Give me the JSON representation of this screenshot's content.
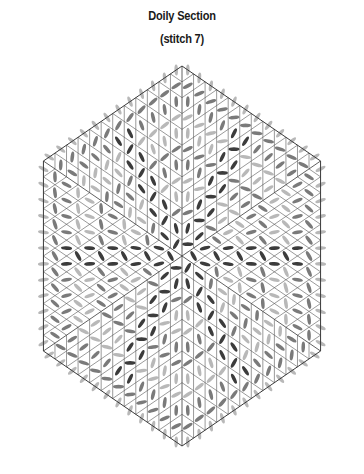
{
  "title": "Doily Section",
  "subtitle": "(stitch 7)",
  "diagram": {
    "type": "hexagonal-stitch-pattern",
    "center": [
      182,
      256
    ],
    "radius": 190,
    "sectors": 6,
    "grid_divisions": 12,
    "colors": {
      "outline": "#3a3a3a",
      "grid": "#555555",
      "stitch_dark": "#3c3c3c",
      "stitch_mid": "#7a7a7a",
      "stitch_light": "#b8b8b8",
      "background": "#ffffff"
    }
  }
}
